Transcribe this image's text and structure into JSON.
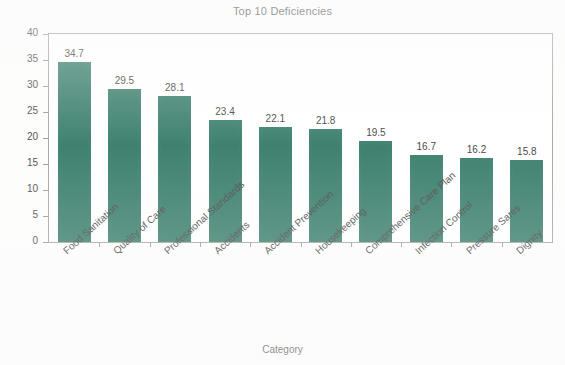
{
  "chart_data": {
    "type": "bar",
    "title": "Top 10 Deficiencies",
    "xlabel": "Category",
    "ylabel": "% Facilities with Deficiencies",
    "categories": [
      "Food Sanitation",
      "Quality of Care",
      "Professional Standards",
      "Accidents",
      "Accident Prevention",
      "Housekeeping",
      "Comprehensive Care Plan",
      "Infection Control",
      "Pressure Sares",
      "Dignity"
    ],
    "values": [
      34.7,
      29.5,
      28.1,
      23.4,
      22.1,
      21.8,
      19.5,
      16.7,
      16.2,
      15.8
    ],
    "data_labels": [
      "34.7",
      "29.5",
      "28.1",
      "23.4",
      "22.1",
      "21.8",
      "19.5",
      "16.7",
      "16.2",
      "15.8"
    ],
    "ylim": [
      0,
      40
    ],
    "yticks": [
      0,
      5,
      10,
      15,
      20,
      25,
      30,
      35,
      40
    ],
    "ytick_labels": [
      "0",
      "5",
      "10",
      "15",
      "20",
      "25",
      "30",
      "35",
      "40"
    ],
    "grid": false,
    "legend": false,
    "bar_color": "#1d6b56",
    "frame_color": "#9a9a9a",
    "background_color": "#ffffff"
  }
}
